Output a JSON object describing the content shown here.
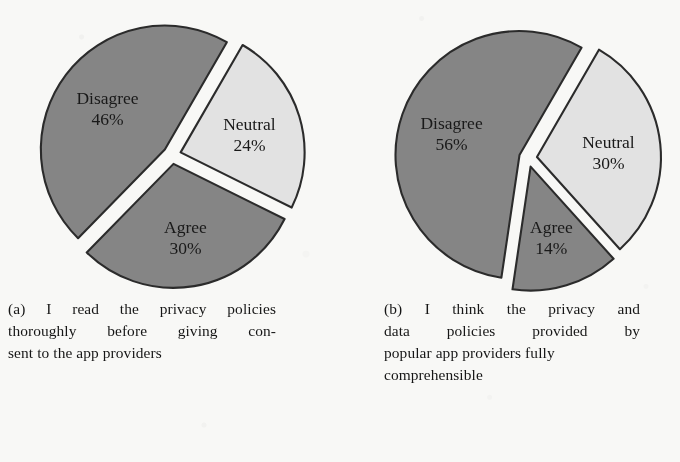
{
  "figure": {
    "background_color": "#f8f8f6",
    "panels": [
      {
        "id": "panel-a",
        "caption_label": "(a)",
        "caption_text": "(a) I read the privacy policies thoroughly before giving con-sent to the app providers",
        "caption_lines": [
          [
            "(a)",
            "I",
            "read",
            "the",
            "privacy",
            "policies"
          ],
          [
            "thoroughly",
            "before",
            "giving",
            "con-"
          ],
          [
            "sent to the app providers"
          ]
        ]
      },
      {
        "id": "panel-b",
        "caption_label": "(b)",
        "caption_text": "(b) I think the privacy and data policies provided by popular app providers fully comprehensible",
        "caption_lines": [
          [
            "(b)",
            "I",
            "think",
            "the",
            "privacy",
            "and"
          ],
          [
            "data",
            "policies",
            "provided",
            "by"
          ],
          [
            "popular app providers fully"
          ],
          [
            "comprehensible"
          ]
        ]
      }
    ]
  },
  "chart_data": [
    {
      "type": "pie",
      "id": "pie-a",
      "title": "(a) I read the privacy policies thoroughly before giving consent to the app providers",
      "categories": [
        "Neutral",
        "Agree",
        "Disagree"
      ],
      "values": [
        24,
        30,
        46
      ],
      "labels": [
        "Neutral 24%",
        "Agree 30%",
        "Disagree 46%"
      ],
      "value_labels": [
        "24%",
        "30%",
        "46%"
      ],
      "units": "percent",
      "exploded": true,
      "legend": "none",
      "slice_colors": [
        "#e2e2e2",
        "#858585",
        "#858585"
      ],
      "outline_color": "#2b2b2b",
      "start_angle_deg": -60
    },
    {
      "type": "pie",
      "id": "pie-b",
      "title": "(b) I think the privacy and data policies provided by popular app providers fully comprehensible",
      "categories": [
        "Neutral",
        "Agree",
        "Disagree"
      ],
      "values": [
        30,
        14,
        56
      ],
      "labels": [
        "Neutral 30%",
        "Agree 14%",
        "Disagree 56%"
      ],
      "value_labels": [
        "30%",
        "14%",
        "56%"
      ],
      "units": "percent",
      "exploded": true,
      "legend": "none",
      "slice_colors": [
        "#e2e2e2",
        "#858585",
        "#858585"
      ],
      "outline_color": "#2b2b2b",
      "start_angle_deg": -60
    }
  ]
}
